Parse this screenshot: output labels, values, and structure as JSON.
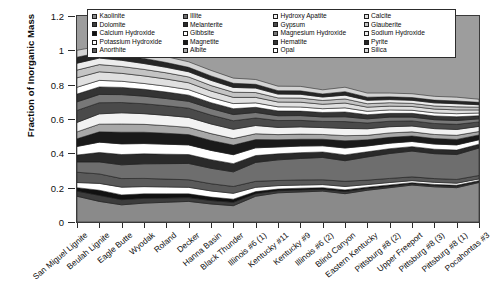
{
  "chart_data": {
    "type": "area",
    "title": "",
    "xlabel": "",
    "ylabel": "Fraction of Inorganic Mass",
    "ylim": [
      0,
      1.2
    ],
    "yticks": [
      "0",
      "0.2",
      "0.4",
      "0.6",
      "0.8",
      "1",
      "1.2"
    ],
    "ytick_values": [
      0,
      0.2,
      0.4,
      0.6,
      0.8,
      1,
      1.2
    ],
    "grid": false,
    "stacked": true,
    "legend_position": "top-inside",
    "legend_columns": 4,
    "background_color": "#9d9d9d",
    "categories": [
      "San Miguel Lignite",
      "Beulah Lignite",
      "Eagle Butte",
      "Wyodak",
      "Roland",
      "Decker",
      "Hanna Basin",
      "Black Thunder",
      "Illinois #6 (1)",
      "Kentucky #11",
      "Kentucky #9",
      "Illinois #6 (2)",
      "Blind Canyon",
      "Eastern Kentucky",
      "Pittsburg #8 (2)",
      "Upper Freeport",
      "Pittsburg #8 (3)",
      "Pittsburg #8 (1)",
      "Pocahontas #3"
    ],
    "series": [
      {
        "name": "Kaolinite",
        "color": "#8a8a8a",
        "values": [
          0.15,
          0.12,
          0.1,
          0.11,
          0.115,
          0.12,
          0.105,
          0.095,
          0.15,
          0.17,
          0.175,
          0.18,
          0.165,
          0.185,
          0.2,
          0.215,
          0.205,
          0.2,
          0.23
        ]
      },
      {
        "name": "Dolomite",
        "color": "#3c3c3c",
        "values": [
          0.03,
          0.035,
          0.03,
          0.028,
          0.025,
          0.022,
          0.02,
          0.02,
          0.015,
          0.012,
          0.012,
          0.01,
          0.012,
          0.01,
          0.008,
          0.008,
          0.008,
          0.008,
          0.006
        ]
      },
      {
        "name": "Calcium Hydroxide",
        "color": "#111111",
        "values": [
          0.02,
          0.03,
          0.028,
          0.026,
          0.024,
          0.022,
          0.02,
          0.018,
          0.012,
          0.01,
          0.01,
          0.01,
          0.01,
          0.008,
          0.008,
          0.006,
          0.006,
          0.006,
          0.005
        ]
      },
      {
        "name": "Potassium Hydroxide",
        "color": "#ffffff",
        "values": [
          0.03,
          0.04,
          0.045,
          0.042,
          0.04,
          0.038,
          0.036,
          0.034,
          0.025,
          0.02,
          0.018,
          0.018,
          0.02,
          0.015,
          0.014,
          0.012,
          0.012,
          0.012,
          0.01
        ]
      },
      {
        "name": "Anorthite",
        "color": "#5a5a5a",
        "values": [
          0.06,
          0.055,
          0.05,
          0.048,
          0.046,
          0.044,
          0.042,
          0.04,
          0.035,
          0.03,
          0.03,
          0.028,
          0.03,
          0.026,
          0.024,
          0.022,
          0.022,
          0.022,
          0.02
        ]
      },
      {
        "name": "Illite",
        "color": "#6e6e6e",
        "values": [
          0.06,
          0.07,
          0.08,
          0.085,
          0.09,
          0.095,
          0.09,
          0.085,
          0.11,
          0.12,
          0.125,
          0.13,
          0.12,
          0.135,
          0.145,
          0.15,
          0.145,
          0.145,
          0.16
        ]
      },
      {
        "name": "Melanterite",
        "color": "#2a2a2a",
        "values": [
          0.04,
          0.055,
          0.06,
          0.058,
          0.055,
          0.052,
          0.05,
          0.048,
          0.04,
          0.035,
          0.034,
          0.032,
          0.034,
          0.03,
          0.028,
          0.026,
          0.026,
          0.026,
          0.022
        ]
      },
      {
        "name": "Gibbsite",
        "color": "#ffffff",
        "values": [
          0.05,
          0.06,
          0.062,
          0.06,
          0.058,
          0.056,
          0.054,
          0.052,
          0.045,
          0.04,
          0.038,
          0.036,
          0.04,
          0.034,
          0.032,
          0.03,
          0.03,
          0.03,
          0.026
        ]
      },
      {
        "name": "Magnetite",
        "color": "#1a1a1a",
        "values": [
          0.045,
          0.06,
          0.068,
          0.066,
          0.064,
          0.06,
          0.058,
          0.056,
          0.048,
          0.042,
          0.04,
          0.038,
          0.042,
          0.036,
          0.034,
          0.032,
          0.032,
          0.032,
          0.028
        ]
      },
      {
        "name": "Albite",
        "color": "#a8a8a8",
        "values": [
          0.04,
          0.045,
          0.048,
          0.046,
          0.044,
          0.042,
          0.04,
          0.038,
          0.034,
          0.03,
          0.03,
          0.028,
          0.03,
          0.026,
          0.026,
          0.024,
          0.024,
          0.024,
          0.02
        ]
      },
      {
        "name": "Hydroxy Apatite",
        "color": "#f2f2f2",
        "values": [
          0.055,
          0.06,
          0.065,
          0.062,
          0.06,
          0.058,
          0.056,
          0.054,
          0.048,
          0.042,
          0.042,
          0.04,
          0.042,
          0.038,
          0.036,
          0.034,
          0.034,
          0.034,
          0.03
        ]
      },
      {
        "name": "Gypsum",
        "color": "#4a4a4a",
        "values": [
          0.07,
          0.065,
          0.06,
          0.058,
          0.056,
          0.054,
          0.052,
          0.05,
          0.044,
          0.04,
          0.038,
          0.036,
          0.04,
          0.034,
          0.032,
          0.03,
          0.03,
          0.03,
          0.026
        ]
      },
      {
        "name": "Magnesium Hydroxide",
        "color": "#787878",
        "values": [
          0.05,
          0.048,
          0.046,
          0.044,
          0.042,
          0.04,
          0.038,
          0.036,
          0.032,
          0.028,
          0.028,
          0.026,
          0.028,
          0.024,
          0.024,
          0.022,
          0.022,
          0.022,
          0.018
        ]
      },
      {
        "name": "Hematite",
        "color": "#343434",
        "values": [
          0.045,
          0.044,
          0.042,
          0.04,
          0.038,
          0.036,
          0.034,
          0.034,
          0.03,
          0.028,
          0.026,
          0.026,
          0.028,
          0.024,
          0.022,
          0.022,
          0.022,
          0.022,
          0.018
        ]
      },
      {
        "name": "Opal",
        "color": "#ffffff",
        "values": [
          0.04,
          0.038,
          0.036,
          0.034,
          0.034,
          0.032,
          0.03,
          0.03,
          0.026,
          0.024,
          0.024,
          0.022,
          0.024,
          0.02,
          0.02,
          0.018,
          0.018,
          0.018,
          0.016
        ]
      },
      {
        "name": "Calcite",
        "color": "#e0e0e0",
        "values": [
          0.055,
          0.05,
          0.046,
          0.044,
          0.042,
          0.04,
          0.038,
          0.036,
          0.032,
          0.028,
          0.028,
          0.026,
          0.028,
          0.024,
          0.022,
          0.022,
          0.022,
          0.022,
          0.018
        ]
      },
      {
        "name": "Glauberite",
        "color": "#c4c4c4",
        "values": [
          0.045,
          0.042,
          0.04,
          0.038,
          0.036,
          0.034,
          0.032,
          0.03,
          0.028,
          0.024,
          0.024,
          0.022,
          0.024,
          0.02,
          0.02,
          0.018,
          0.018,
          0.018,
          0.016
        ]
      },
      {
        "name": "Sodium Hydroxide",
        "color": "#ededed",
        "values": [
          0.04,
          0.038,
          0.036,
          0.034,
          0.032,
          0.03,
          0.03,
          0.028,
          0.026,
          0.022,
          0.022,
          0.02,
          0.022,
          0.02,
          0.018,
          0.018,
          0.018,
          0.018,
          0.014
        ]
      },
      {
        "name": "Pyrite",
        "color": "#262626",
        "values": [
          0.035,
          0.032,
          0.03,
          0.03,
          0.028,
          0.026,
          0.026,
          0.024,
          0.022,
          0.02,
          0.02,
          0.018,
          0.02,
          0.018,
          0.016,
          0.016,
          0.016,
          0.016,
          0.014
        ]
      },
      {
        "name": "Silica",
        "color": "#d4d4d4",
        "values": [
          0.04,
          0.038,
          0.036,
          0.034,
          0.034,
          0.032,
          0.032,
          0.03,
          0.028,
          0.026,
          0.026,
          0.024,
          0.026,
          0.024,
          0.022,
          0.022,
          0.022,
          0.022,
          0.018
        ]
      }
    ]
  },
  "axes": {
    "y_title": "Fraction of Inorganic Mass"
  }
}
